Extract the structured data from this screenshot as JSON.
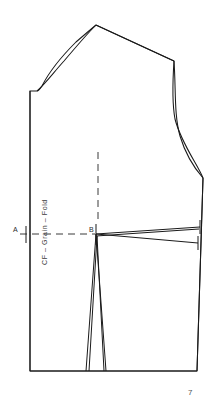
{
  "document": {
    "kind": "sewing-pattern-draft",
    "title": "Bodice Front Block",
    "page_number": "7",
    "background_color": "#ffffff",
    "ink_color": "#1a1a1a"
  },
  "labels": {
    "point_a": "A",
    "point_b": "B",
    "grain_line": "CF – Grain – Fold"
  },
  "chart_data": {
    "type": "diagram",
    "annotations": [
      {
        "name": "point-a",
        "text": "A",
        "x": 15,
        "y": 230
      },
      {
        "name": "point-b",
        "text": "B",
        "x": 91,
        "y": 230
      },
      {
        "name": "grain-line-text",
        "text": "CF – Grain – Fold",
        "x": 47,
        "y": 225,
        "rotation": -90
      },
      {
        "name": "page-number",
        "text": "7",
        "x": 190,
        "y": 392
      }
    ],
    "paths": {
      "outline": "M 30 91 L 30 371 L 197 371 L 203 178 C 198 165 181 143 175 119 C 172 103 173 76 174 61 L 96 25 C 90 30 83 36 76 42 C 62 56 48 74 42 86 C 40 89 38 91 37 91 Z",
      "centre_front": "M 30 91 L 30 371",
      "hem": "M 30 371 L 197 371",
      "side_seam": "M 203 178 L 197 371",
      "armhole": "M 174 61 C 176 90 174 115 180 136 C 186 156 196 170 203 178",
      "shoulder": "M 96 25 L 174 61",
      "neckline": "M 37 91 C 45 84 54 72 64 61 C 75 48 87 34 96 25",
      "grain_dashed": "M 98 152 L 98 222",
      "waist_dashed": "M 20 234 L 95 234",
      "bust_dart_upper": "M 96 234 L 200 227",
      "bust_dart_lower": "M 96 234 L 198 243",
      "bust_dart_mid": "M 96 236 L 199 229",
      "waist_dart_left": "M 96 234 L 86 371",
      "waist_dart_right": "M 96 234 L 106 371",
      "waist_dart_inner_left": "M 97 236 L 89 371",
      "waist_dart_inner_right": "M 97 236 L 104 371",
      "tick_a_vertical": "M 26 226 L 26 243",
      "tick_b_vertical": "M 96 224 L 96 245",
      "tick_side_upper": "M 200 220 L 200 234",
      "tick_side_lower": "M 198 236 L 198 250"
    },
    "axis_points": [
      {
        "label": "A",
        "x": 26,
        "y": 234,
        "note": "centre front at bust level"
      },
      {
        "label": "B",
        "x": 96,
        "y": 234,
        "note": "bust point / dart apex"
      }
    ]
  }
}
